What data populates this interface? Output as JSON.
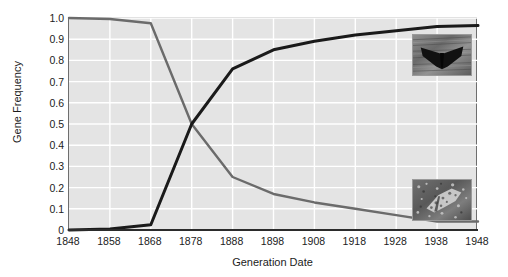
{
  "chart_data": {
    "type": "line",
    "title": "",
    "xlabel": "Generation Date",
    "ylabel": "Gene Frequency",
    "xlim": [
      1848,
      1948
    ],
    "ylim": [
      0,
      1.0
    ],
    "grid": true,
    "legend_position": "none",
    "x_tick_labels": [
      "1848",
      "1858",
      "1868",
      "1878",
      "1888",
      "1898",
      "1908",
      "1918",
      "1928",
      "1938",
      "1948"
    ],
    "y_tick_labels": [
      "0",
      "0.1",
      "0.2",
      "0.3",
      "0.4",
      "0.5",
      "0.6",
      "0.7",
      "0.8",
      "0.9",
      "1.0"
    ],
    "x": [
      1848,
      1858,
      1868,
      1878,
      1888,
      1898,
      1908,
      1918,
      1928,
      1938,
      1948
    ],
    "series": [
      {
        "name": "light (typica) gene frequency",
        "color": "#6b6b6b",
        "values": [
          1.0,
          0.995,
          0.975,
          0.5,
          0.25,
          0.17,
          0.13,
          0.1,
          0.07,
          0.04,
          0.04
        ]
      },
      {
        "name": "melanic (carbonaria) gene frequency",
        "color": "#1a1a1a",
        "values": [
          0.0,
          0.005,
          0.025,
          0.5,
          0.76,
          0.85,
          0.89,
          0.92,
          0.94,
          0.96,
          0.965
        ]
      }
    ],
    "annotations": [
      {
        "name": "dark-moth-photo",
        "caption": "melanic moth on dark bark",
        "x_position": 1933,
        "y_position": 0.86
      },
      {
        "name": "light-moth-photo",
        "caption": "light speckled moth on lichen",
        "x_position": 1933,
        "y_position": 0.18
      }
    ]
  }
}
